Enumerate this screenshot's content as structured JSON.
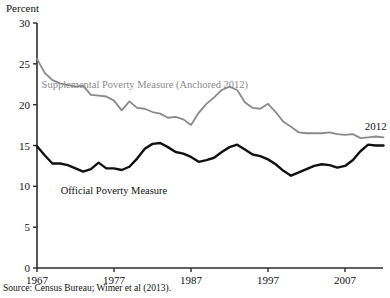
{
  "figure": {
    "axis_title": "Percent",
    "source_note": "Source: Census Bureau; Wimer et al (2013).",
    "end_year_annotation": "2012"
  },
  "labels": {
    "spm": "Supplemental Poverty Measure (Anchored 2012)",
    "opm": "Official Poverty Measure"
  },
  "colors": {
    "spm_line": "#8a8a8a",
    "opm_line": "#111111",
    "axis": "#2b2b2b",
    "background": "#ffffff"
  },
  "chart_data": {
    "type": "line",
    "title": "",
    "subtitle": "",
    "xlabel": "",
    "ylabel": "Percent",
    "xlim": [
      1967,
      2012
    ],
    "ylim": [
      0,
      30
    ],
    "grid": false,
    "legend": "inline-annotations",
    "xticks": [
      1967,
      1977,
      1987,
      1997,
      2007
    ],
    "xtick_labels": [
      "1967",
      "1977",
      "1987",
      "1997",
      "2007"
    ],
    "yticks": [
      0,
      5,
      10,
      15,
      20,
      25,
      30
    ],
    "ytick_labels": [
      "0",
      "5",
      "10",
      "15",
      "20",
      "25",
      "30"
    ],
    "x": [
      1967,
      1968,
      1969,
      1970,
      1971,
      1972,
      1973,
      1974,
      1975,
      1976,
      1977,
      1978,
      1979,
      1980,
      1981,
      1982,
      1983,
      1984,
      1985,
      1986,
      1987,
      1988,
      1989,
      1990,
      1991,
      1992,
      1993,
      1994,
      1995,
      1996,
      1997,
      1998,
      1999,
      2000,
      2001,
      2002,
      2003,
      2004,
      2005,
      2006,
      2007,
      2008,
      2009,
      2010,
      2011,
      2012
    ],
    "series": [
      {
        "name": "Supplemental Poverty Measure (Anchored 2012)",
        "color": "#8a8a8a",
        "values": [
          25.6,
          23.9,
          23.0,
          22.6,
          22.4,
          22.2,
          22.3,
          21.2,
          21.1,
          21.0,
          20.5,
          19.3,
          20.4,
          19.6,
          19.5,
          19.1,
          18.9,
          18.4,
          18.5,
          18.2,
          17.5,
          19.0,
          20.1,
          20.9,
          21.8,
          22.2,
          21.8,
          20.3,
          19.6,
          19.5,
          20.1,
          19.1,
          17.9,
          17.3,
          16.6,
          16.5,
          16.5,
          16.5,
          16.6,
          16.4,
          16.3,
          16.4,
          15.9,
          16.0,
          16.1,
          16.0
        ]
      },
      {
        "name": "Official Poverty Measure",
        "color": "#111111",
        "values": [
          14.9,
          13.8,
          12.8,
          12.8,
          12.6,
          12.2,
          11.8,
          12.1,
          12.9,
          12.2,
          12.2,
          12.0,
          12.4,
          13.4,
          14.6,
          15.2,
          15.3,
          14.8,
          14.2,
          14.0,
          13.6,
          13.0,
          13.2,
          13.5,
          14.2,
          14.8,
          15.1,
          14.5,
          13.9,
          13.7,
          13.3,
          12.7,
          11.9,
          11.3,
          11.7,
          12.1,
          12.5,
          12.7,
          12.6,
          12.3,
          12.5,
          13.2,
          14.3,
          15.1,
          15.0,
          15.0
        ]
      }
    ],
    "annotations": [
      {
        "text": "Supplemental Poverty Measure (Anchored 2012)",
        "x": 1981,
        "y": 22.5,
        "color": "#8a8a8a"
      },
      {
        "text": "Official Poverty Measure",
        "x": 1977,
        "y": 9.6,
        "color": "#111111"
      },
      {
        "text": "2012",
        "x": 2011,
        "y": 17.4,
        "color": "#111111"
      }
    ]
  }
}
